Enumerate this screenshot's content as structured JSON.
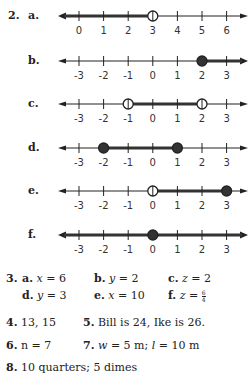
{
  "problem2": {
    "number": "2.",
    "lines": [
      {
        "letter": "a.",
        "y": 16,
        "ticks": [
          "0",
          "1",
          "2",
          "3",
          "4",
          "5",
          "6"
        ],
        "tick_values": [
          0,
          1,
          2,
          3,
          4,
          5,
          6
        ],
        "shade": {
          "from": "left-arrow",
          "to": 3
        },
        "points": [
          {
            "value": 3,
            "filled": false
          }
        ],
        "left_arrow_bold": true,
        "right_arrow_bold": false
      },
      {
        "letter": "b.",
        "y": 61,
        "ticks": [
          "-3",
          "-2",
          "-1",
          "0",
          "1",
          "2",
          "3"
        ],
        "tick_values": [
          -3,
          -2,
          -1,
          0,
          1,
          2,
          3
        ],
        "shade": {
          "from": 2,
          "to": "right-arrow"
        },
        "points": [
          {
            "value": 2,
            "filled": true
          }
        ],
        "left_arrow_bold": false,
        "right_arrow_bold": true
      },
      {
        "letter": "c.",
        "y": 104,
        "ticks": [
          "-3",
          "-2",
          "-1",
          "0",
          "1",
          "2",
          "3"
        ],
        "tick_values": [
          -3,
          -2,
          -1,
          0,
          1,
          2,
          3
        ],
        "shade": {
          "from": -1,
          "to": 2
        },
        "points": [
          {
            "value": -1,
            "filled": false
          },
          {
            "value": 2,
            "filled": false
          }
        ],
        "left_arrow_bold": false,
        "right_arrow_bold": false
      },
      {
        "letter": "d.",
        "y": 148,
        "ticks": [
          "-3",
          "-2",
          "-1",
          "0",
          "1",
          "2",
          "3"
        ],
        "tick_values": [
          -3,
          -2,
          -1,
          0,
          1,
          2,
          3
        ],
        "shade": {
          "from": -2,
          "to": 1
        },
        "points": [
          {
            "value": -2,
            "filled": true
          },
          {
            "value": 1,
            "filled": true
          }
        ],
        "left_arrow_bold": false,
        "right_arrow_bold": false
      },
      {
        "letter": "e.",
        "y": 191,
        "ticks": [
          "-3",
          "-2",
          "-1",
          "0",
          "1",
          "2",
          "3"
        ],
        "tick_values": [
          -3,
          -2,
          -1,
          0,
          1,
          2,
          3
        ],
        "shade": {
          "from": 0,
          "to": 3
        },
        "points": [
          {
            "value": 0,
            "filled": false
          },
          {
            "value": 3,
            "filled": true
          }
        ],
        "left_arrow_bold": false,
        "right_arrow_bold": false
      },
      {
        "letter": "f.",
        "y": 235,
        "ticks": [
          "-3",
          "-2",
          "-1",
          "0",
          "1",
          "2",
          "3"
        ],
        "tick_values": [
          -3,
          -2,
          -1,
          0,
          1,
          2,
          3
        ],
        "shade": {
          "from": "left-arrow",
          "to": "right-arrow"
        },
        "points": [
          {
            "value": 0,
            "filled": true
          }
        ],
        "left_arrow_bold": true,
        "right_arrow_bold": true
      }
    ]
  },
  "problem3": {
    "number": "3.",
    "items": [
      {
        "letter": "a.",
        "var": "x",
        "eq": " = 6"
      },
      {
        "letter": "b.",
        "var": "y",
        "eq": " = 2"
      },
      {
        "letter": "c.",
        "var": "z",
        "eq": " = 2"
      },
      {
        "letter": "d.",
        "var": "y",
        "eq": " = 3"
      },
      {
        "letter": "e.",
        "var": "x",
        "eq": " = 10"
      },
      {
        "letter": "f.",
        "var": "z",
        "eq": " = ",
        "frac_num": "6",
        "frac_den": "4"
      }
    ]
  },
  "problem4": {
    "number": "4.",
    "text": "13, 15"
  },
  "problem5": {
    "number": "5.",
    "text": "Bill is 24, Ike is 26."
  },
  "problem6": {
    "number": "6.",
    "var": "n",
    "text": " = 7"
  },
  "problem7": {
    "number": "7.",
    "w_var": "w",
    "w_text": " = 5 m; ",
    "l_var": "l",
    "l_text": " = 10 m"
  },
  "problem8": {
    "number": "8.",
    "text": "10 quarters; 5 dimes"
  },
  "colors": {
    "ink": "#222222",
    "shade": "#333333",
    "paper": "#ffffff"
  }
}
